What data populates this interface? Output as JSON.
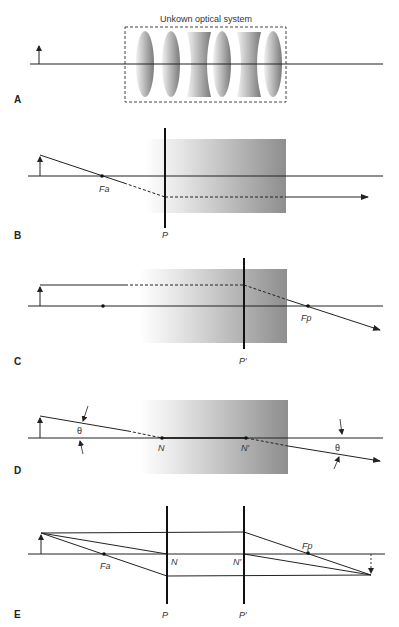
{
  "figure": {
    "panels": [
      {
        "id": "A",
        "label": "A",
        "title": "Unkown optical system"
      },
      {
        "id": "B",
        "label": "B",
        "points": {
          "focal_anterior": "Fa",
          "plane": "P"
        }
      },
      {
        "id": "C",
        "label": "C",
        "points": {
          "focal_posterior": "Fp",
          "plane": "P′"
        }
      },
      {
        "id": "D",
        "label": "D",
        "points": {
          "nodal": "N",
          "nodal_prime": "N′",
          "angle_in": "θ",
          "angle_out": "θ"
        }
      },
      {
        "id": "E",
        "label": "E",
        "points": {
          "focal_anterior": "Fa",
          "focal_posterior": "Fp",
          "nodal": "N",
          "nodal_prime": "N′",
          "plane": "P",
          "plane_prime": "P′"
        }
      }
    ]
  },
  "colors": {
    "line": "#222222",
    "shade_dark": "#8f8f8f",
    "shade_light": "#ffffff",
    "box_dash": "#444444"
  }
}
